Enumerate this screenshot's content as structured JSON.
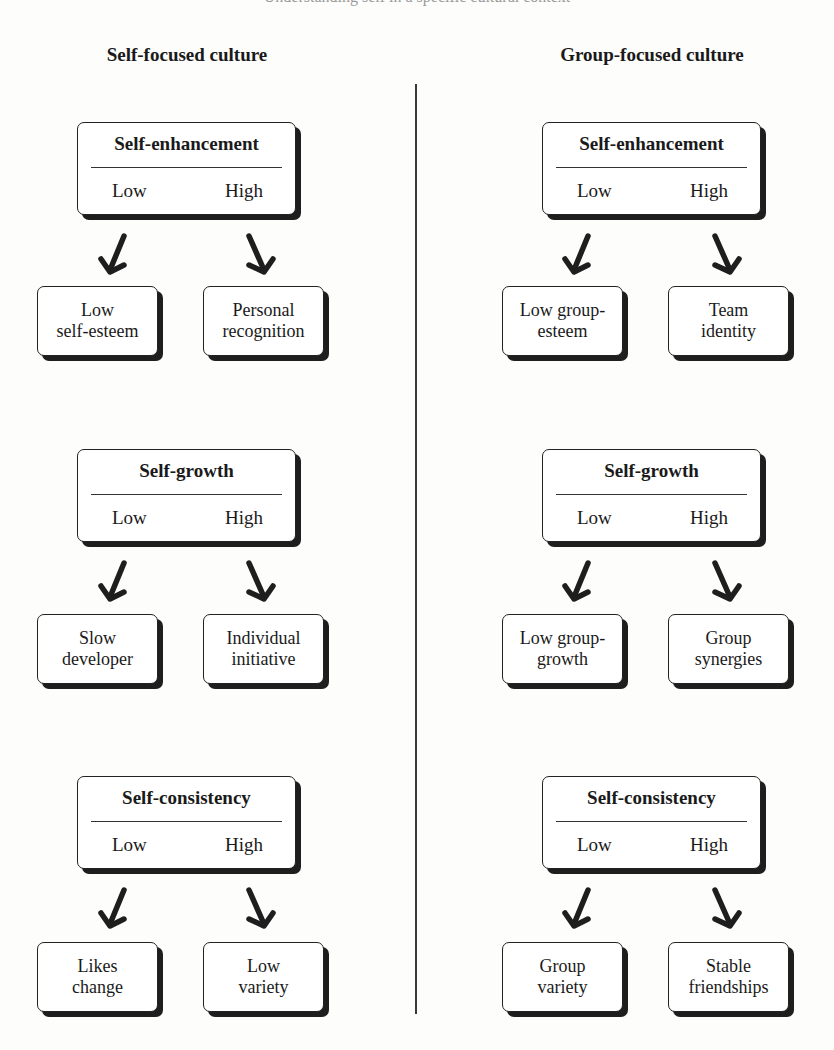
{
  "caption_cut": "Understanding self in a specific cultural context",
  "columns": [
    {
      "title": "Self-focused culture",
      "sections": [
        {
          "title": "Self-enhancement",
          "low": "Low",
          "high": "High",
          "outcomes": {
            "low": "Low self-esteem",
            "high": "Personal recognition"
          }
        },
        {
          "title": "Self-growth",
          "low": "Low",
          "high": "High",
          "outcomes": {
            "low": "Slow developer",
            "high": "Individual initiative"
          }
        },
        {
          "title": "Self-consistency",
          "low": "Low",
          "high": "High",
          "outcomes": {
            "low": "Likes change",
            "high": "Low variety"
          }
        }
      ]
    },
    {
      "title": "Group-focused culture",
      "sections": [
        {
          "title": "Self-enhancement",
          "low": "Low",
          "high": "High",
          "outcomes": {
            "low": "Low group-esteem",
            "high": "Team identity"
          }
        },
        {
          "title": "Self-growth",
          "low": "Low",
          "high": "High",
          "outcomes": {
            "low": "Low group-growth",
            "high": "Group synergies"
          }
        },
        {
          "title": "Self-consistency",
          "low": "Low",
          "high": "High",
          "outcomes": {
            "low": "Group variety",
            "high": "Stable friendships"
          }
        }
      ]
    }
  ],
  "outcome_lines": {
    "c0s0low": [
      "Low",
      "self-esteem"
    ],
    "c0s0high": [
      "Personal",
      "recognition"
    ],
    "c0s1low": [
      "Slow",
      "developer"
    ],
    "c0s1high": [
      "Individual",
      "initiative"
    ],
    "c0s2low": [
      "Likes",
      "change"
    ],
    "c0s2high": [
      "Low",
      "variety"
    ],
    "c1s0low": [
      "Low group-",
      "esteem"
    ],
    "c1s0high": [
      "Team",
      "identity"
    ],
    "c1s1low": [
      "Low group-",
      "growth"
    ],
    "c1s1high": [
      "Group",
      "synergies"
    ],
    "c1s2low": [
      "Group",
      "variety"
    ],
    "c1s2high": [
      "Stable",
      "friendships"
    ]
  },
  "colors": {
    "ink": "#1a1a1a",
    "shadow": "#1e1e1e",
    "background": "#fdfdfc"
  }
}
